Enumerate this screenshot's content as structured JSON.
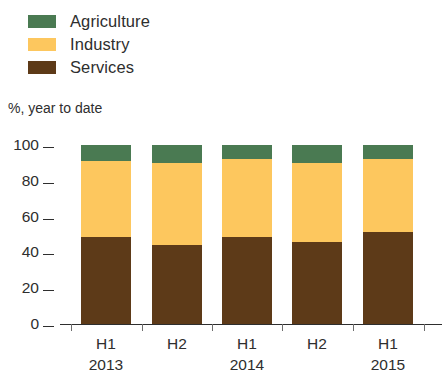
{
  "legend": {
    "items": [
      {
        "label": "Agriculture",
        "color": "#4a7a52",
        "icon": "legend-swatch-agriculture"
      },
      {
        "label": "Industry",
        "color": "#fdc75e",
        "icon": "legend-swatch-industry"
      },
      {
        "label": "Services",
        "color": "#5d3a18",
        "icon": "legend-swatch-services"
      }
    ]
  },
  "axis_caption": "%, year to date",
  "chart_data": {
    "type": "bar",
    "title": "",
    "subtitle": "",
    "xlabel": "",
    "ylabel": "%, year to date",
    "stacked": true,
    "grid": false,
    "legend_position": "top-left",
    "ylim": [
      0,
      100
    ],
    "yticks": [
      0,
      20,
      40,
      60,
      80,
      100
    ],
    "ytick_labels": [
      "0",
      "20",
      "40",
      "60",
      "80",
      "100"
    ],
    "categories": [
      "H1",
      "H2",
      "H1",
      "H2",
      "H1"
    ],
    "category_groups": [
      {
        "year": "2013",
        "periods": [
          "H1",
          "H2"
        ]
      },
      {
        "year": "2014",
        "periods": [
          "H1",
          "H2"
        ]
      },
      {
        "year": "2015",
        "periods": [
          "H1"
        ]
      }
    ],
    "x_labels": [
      {
        "period": "H1",
        "year": "2013"
      },
      {
        "period": "H2",
        "year": ""
      },
      {
        "period": "H1",
        "year": "2014"
      },
      {
        "period": "H2",
        "year": ""
      },
      {
        "period": "H1",
        "year": "2015"
      }
    ],
    "series": [
      {
        "name": "Services",
        "color": "#5d3a18",
        "values": [
          48.6,
          44.0,
          48.6,
          46.0,
          51.4
        ]
      },
      {
        "name": "Industry",
        "color": "#fdc75e",
        "values": [
          42.4,
          46.0,
          43.4,
          44.0,
          40.6
        ]
      },
      {
        "name": "Agriculture",
        "color": "#4a7a52",
        "values": [
          9.0,
          10.0,
          8.0,
          10.0,
          8.0
        ]
      }
    ],
    "totals": [
      100,
      100,
      100,
      100,
      100
    ]
  }
}
